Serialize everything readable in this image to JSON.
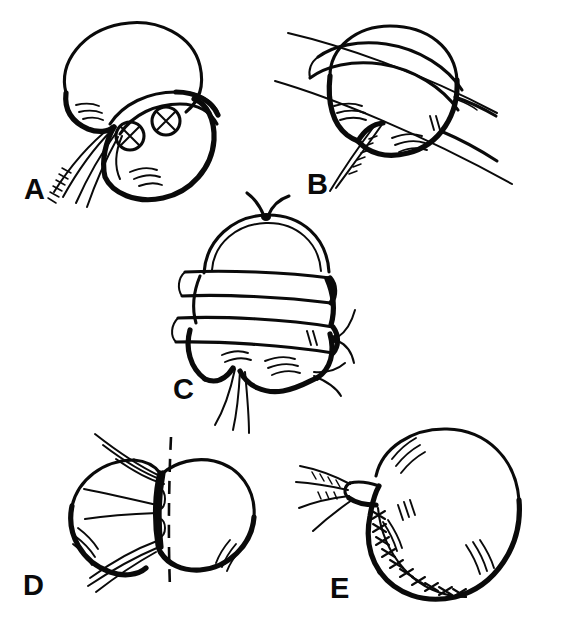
{
  "figure": {
    "background_color": "#ffffff",
    "ink_color": "#0a0a0a",
    "width": 562,
    "height": 623,
    "panel_count": 5
  },
  "panels": [
    {
      "id": "A",
      "label": "A",
      "label_x": 24,
      "label_y": 199,
      "caption": "Kidney with lower pole mass marked by two circled-X lesion markings; hilar vessels and ureter at lower left",
      "markings": [
        {
          "name": "circled-x-lesion-lower",
          "cx": 130,
          "cy": 136,
          "r": 14
        },
        {
          "name": "circled-x-lesion-upper",
          "cx": 166,
          "cy": 121,
          "r": 14
        }
      ]
    },
    {
      "id": "B",
      "label": "B",
      "label_x": 307,
      "label_y": 194,
      "caption": "Encircling tourniquet band in place and scalpel blade passing obliquely across the kidney",
      "markings": []
    },
    {
      "id": "C",
      "label": "C",
      "label_x": 173,
      "label_y": 399,
      "caption": "Two parallel constricting bands applied across the kidney with tied suture knots above and at the right margin",
      "markings": []
    },
    {
      "id": "D",
      "label": "D",
      "label_x": 23,
      "label_y": 595,
      "caption": "Bilobed kidney retracted at the isthmus with dashed vertical line indicating the plane of division",
      "markings": []
    },
    {
      "id": "E",
      "label": "E",
      "label_x": 330,
      "label_y": 598,
      "caption": "Completed repair: cut surface closed with a running interrupted X-stitch suture line; vessels and ureter exit the hilum",
      "markings": []
    }
  ],
  "legend": {
    "circled_x_meaning": "lesion / tumour marking",
    "dashed_line_meaning": "line of resection",
    "x_stitch_meaning": "interrupted suture closure"
  }
}
